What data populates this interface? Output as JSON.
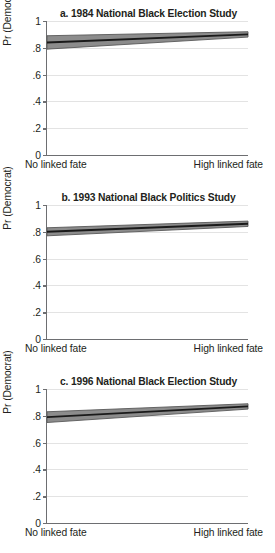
{
  "figure": {
    "width": 275,
    "height": 553,
    "background": "#ffffff",
    "text_color": "#231f20",
    "axis_color": "#6d6e71",
    "grid_color": "#e3e3e3",
    "band_fill": "#8c8c8c",
    "band_edge": "#595959",
    "line_color": "#1a1a1a"
  },
  "axes": {
    "ylabel": "Pr (Democrat)",
    "ytick_labels": [
      "0",
      ".2",
      ".4",
      ".6",
      ".8",
      "1"
    ],
    "ytick_values": [
      0,
      0.2,
      0.4,
      0.6,
      0.8,
      1
    ],
    "ylim": [
      0,
      1
    ],
    "xlabel_left": "No linked fate",
    "xlabel_right": "High linked fate",
    "xlim": [
      0,
      1
    ],
    "grid": "horizontal"
  },
  "panels": [
    {
      "id": "a",
      "title": "a. 1984 National Black Election Study"
    },
    {
      "id": "b",
      "title": "b. 1993 National Black Politics Study"
    },
    {
      "id": "c",
      "title": "c. 1996 National Black Election Study"
    }
  ],
  "chart_data": [
    {
      "type": "line",
      "title": "a. 1984 National Black Election Study",
      "xlabel": "",
      "ylabel": "Pr (Democrat)",
      "ylim": [
        0,
        1
      ],
      "xlim": [
        0,
        1
      ],
      "xtick_labels": [
        "No linked fate",
        "High linked fate"
      ],
      "ytick_labels": [
        "0",
        ".2",
        ".4",
        ".6",
        ".8",
        "1"
      ],
      "grid": "horizontal gridlines only",
      "legend": "none",
      "x": [
        0,
        1
      ],
      "series": [
        {
          "name": "Predicted Pr(Democrat)",
          "values": [
            0.84,
            0.9
          ]
        },
        {
          "name": "95% CI upper",
          "values": [
            0.89,
            0.92
          ]
        },
        {
          "name": "95% CI lower",
          "values": [
            0.79,
            0.88
          ]
        }
      ]
    },
    {
      "type": "line",
      "title": "b. 1993 National Black Politics Study",
      "xlabel": "",
      "ylabel": "Pr (Democrat)",
      "ylim": [
        0,
        1
      ],
      "xlim": [
        0,
        1
      ],
      "xtick_labels": [
        "No linked fate",
        "High linked fate"
      ],
      "ytick_labels": [
        "0",
        ".2",
        ".4",
        ".6",
        ".8",
        "1"
      ],
      "grid": "horizontal gridlines only",
      "legend": "none",
      "x": [
        0,
        1
      ],
      "series": [
        {
          "name": "Predicted Pr(Democrat)",
          "values": [
            0.8,
            0.86
          ]
        },
        {
          "name": "95% CI upper",
          "values": [
            0.83,
            0.88
          ]
        },
        {
          "name": "95% CI lower",
          "values": [
            0.77,
            0.84
          ]
        }
      ]
    },
    {
      "type": "line",
      "title": "c. 1996 National Black Election Study",
      "xlabel": "",
      "ylabel": "Pr (Democrat)",
      "ylim": [
        0,
        1
      ],
      "xlim": [
        0,
        1
      ],
      "xtick_labels": [
        "No linked fate",
        "High linked fate"
      ],
      "ytick_labels": [
        "0",
        ".2",
        ".4",
        ".6",
        ".8",
        "1"
      ],
      "grid": "horizontal gridlines only",
      "legend": "none",
      "x": [
        0,
        1
      ],
      "series": [
        {
          "name": "Predicted Pr(Democrat)",
          "values": [
            0.79,
            0.87
          ]
        },
        {
          "name": "95% CI upper",
          "values": [
            0.83,
            0.89
          ]
        },
        {
          "name": "95% CI lower",
          "values": [
            0.75,
            0.85
          ]
        }
      ]
    }
  ]
}
